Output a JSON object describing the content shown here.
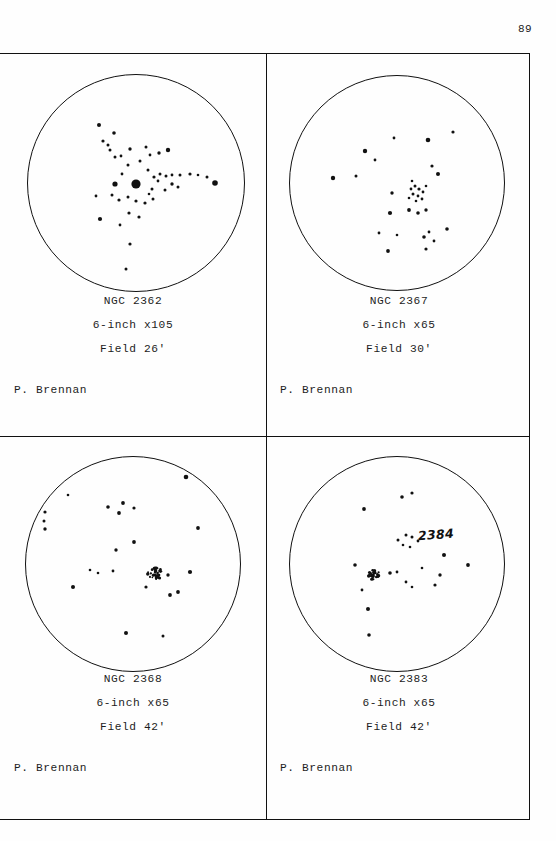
{
  "page": {
    "number": "89",
    "observer_default": "P. Brennan"
  },
  "panels": [
    {
      "id": "ngc-2362",
      "object_name": "NGC 2362",
      "instrument": "6-inch x105",
      "field": "Field 26'",
      "observer": "P. Brennan",
      "circle": {
        "cx": 136,
        "cy": 130,
        "r": 109
      },
      "annotation": null,
      "stars": [
        {
          "x": 136,
          "y": 131,
          "r": 4.6
        },
        {
          "x": 115,
          "y": 131,
          "r": 2.6
        },
        {
          "x": 148,
          "y": 117,
          "r": 1.5
        },
        {
          "x": 154,
          "y": 124,
          "r": 1.6
        },
        {
          "x": 158,
          "y": 128,
          "r": 1.4
        },
        {
          "x": 152,
          "y": 136,
          "r": 1.5
        },
        {
          "x": 149,
          "y": 141,
          "r": 1.3
        },
        {
          "x": 160,
          "y": 121,
          "r": 1.5
        },
        {
          "x": 166,
          "y": 123,
          "r": 1.5
        },
        {
          "x": 172,
          "y": 122,
          "r": 1.4
        },
        {
          "x": 180,
          "y": 122,
          "r": 1.5
        },
        {
          "x": 190,
          "y": 121,
          "r": 1.6
        },
        {
          "x": 198,
          "y": 122,
          "r": 1.3
        },
        {
          "x": 207,
          "y": 124,
          "r": 1.5
        },
        {
          "x": 122,
          "y": 121,
          "r": 1.4
        },
        {
          "x": 128,
          "y": 112,
          "r": 1.5
        },
        {
          "x": 140,
          "y": 108,
          "r": 1.5
        },
        {
          "x": 150,
          "y": 102,
          "r": 1.4
        },
        {
          "x": 159,
          "y": 100,
          "r": 1.7
        },
        {
          "x": 168,
          "y": 97,
          "r": 2.2
        },
        {
          "x": 146,
          "y": 94,
          "r": 1.5
        },
        {
          "x": 130,
          "y": 96,
          "r": 1.7
        },
        {
          "x": 121,
          "y": 103,
          "r": 1.4
        },
        {
          "x": 115,
          "y": 104,
          "r": 1.5
        },
        {
          "x": 110,
          "y": 97,
          "r": 1.5
        },
        {
          "x": 108,
          "y": 92,
          "r": 1.5
        },
        {
          "x": 103,
          "y": 88,
          "r": 1.6
        },
        {
          "x": 114,
          "y": 80,
          "r": 1.8
        },
        {
          "x": 99,
          "y": 72,
          "r": 2.0
        },
        {
          "x": 128,
          "y": 144,
          "r": 1.5
        },
        {
          "x": 136,
          "y": 148,
          "r": 1.6
        },
        {
          "x": 145,
          "y": 150,
          "r": 1.6
        },
        {
          "x": 153,
          "y": 146,
          "r": 1.5
        },
        {
          "x": 119,
          "y": 147,
          "r": 1.6
        },
        {
          "x": 112,
          "y": 142,
          "r": 1.5
        },
        {
          "x": 129,
          "y": 160,
          "r": 1.6
        },
        {
          "x": 139,
          "y": 164,
          "r": 1.6
        },
        {
          "x": 120,
          "y": 172,
          "r": 1.4
        },
        {
          "x": 100,
          "y": 166,
          "r": 2.1
        },
        {
          "x": 96,
          "y": 143,
          "r": 1.4
        },
        {
          "x": 215,
          "y": 130,
          "r": 2.8
        },
        {
          "x": 130,
          "y": 191,
          "r": 1.6
        },
        {
          "x": 126,
          "y": 216,
          "r": 1.5
        },
        {
          "x": 172,
          "y": 131,
          "r": 1.7
        },
        {
          "x": 178,
          "y": 134,
          "r": 1.5
        },
        {
          "x": 165,
          "y": 137,
          "r": 1.5
        }
      ]
    },
    {
      "id": "ngc-2367",
      "object_name": "NGC 2367",
      "instrument": "6-inch x65",
      "field": "Field 30'",
      "observer": "P. Brennan",
      "circle": {
        "cx": 131,
        "cy": 130,
        "r": 108
      },
      "annotation": null,
      "stars": [
        {
          "x": 145,
          "y": 136,
          "r": 1.4
        },
        {
          "x": 149,
          "y": 133,
          "r": 1.5
        },
        {
          "x": 153,
          "y": 136,
          "r": 1.6
        },
        {
          "x": 147,
          "y": 141,
          "r": 1.5
        },
        {
          "x": 152,
          "y": 143,
          "r": 1.4
        },
        {
          "x": 157,
          "y": 139,
          "r": 1.4
        },
        {
          "x": 143,
          "y": 145,
          "r": 1.3
        },
        {
          "x": 150,
          "y": 148,
          "r": 1.3
        },
        {
          "x": 156,
          "y": 146,
          "r": 1.4
        },
        {
          "x": 160,
          "y": 133,
          "r": 1.3
        },
        {
          "x": 146,
          "y": 128,
          "r": 1.3
        },
        {
          "x": 143,
          "y": 157,
          "r": 1.9
        },
        {
          "x": 152,
          "y": 160,
          "r": 1.8
        },
        {
          "x": 160,
          "y": 157,
          "r": 1.7
        },
        {
          "x": 124,
          "y": 160,
          "r": 2.1
        },
        {
          "x": 126,
          "y": 140,
          "r": 1.7
        },
        {
          "x": 172,
          "y": 121,
          "r": 2.0
        },
        {
          "x": 166,
          "y": 113,
          "r": 1.6
        },
        {
          "x": 162,
          "y": 87,
          "r": 2.3
        },
        {
          "x": 128,
          "y": 85,
          "r": 1.4
        },
        {
          "x": 187,
          "y": 79,
          "r": 1.6
        },
        {
          "x": 99,
          "y": 98,
          "r": 2.2
        },
        {
          "x": 109,
          "y": 107,
          "r": 1.4
        },
        {
          "x": 90,
          "y": 123,
          "r": 1.5
        },
        {
          "x": 67,
          "y": 125,
          "r": 2.2
        },
        {
          "x": 113,
          "y": 180,
          "r": 1.4
        },
        {
          "x": 122,
          "y": 198,
          "r": 1.9
        },
        {
          "x": 158,
          "y": 184,
          "r": 1.8
        },
        {
          "x": 163,
          "y": 179,
          "r": 1.4
        },
        {
          "x": 168,
          "y": 188,
          "r": 1.4
        },
        {
          "x": 160,
          "y": 196,
          "r": 1.6
        },
        {
          "x": 181,
          "y": 176,
          "r": 1.8
        },
        {
          "x": 131,
          "y": 182,
          "r": 1.3
        }
      ]
    },
    {
      "id": "ngc-2368",
      "object_name": "NGC 2368",
      "instrument": "6-inch x65",
      "field": "Field 42'",
      "observer": "P. Brennan",
      "circle": {
        "cx": 133,
        "cy": 127,
        "r": 108
      },
      "annotation": null,
      "cluster_clump": {
        "x": 155,
        "y": 136,
        "count": 34,
        "spread": 7.5
      },
      "stars": [
        {
          "x": 168,
          "y": 138,
          "r": 1.7
        },
        {
          "x": 146,
          "y": 150,
          "r": 1.6
        },
        {
          "x": 170,
          "y": 158,
          "r": 1.9
        },
        {
          "x": 190,
          "y": 135,
          "r": 2.1
        },
        {
          "x": 113,
          "y": 134,
          "r": 1.4
        },
        {
          "x": 90,
          "y": 133,
          "r": 1.3
        },
        {
          "x": 116,
          "y": 113,
          "r": 1.7
        },
        {
          "x": 134,
          "y": 105,
          "r": 1.9
        },
        {
          "x": 198,
          "y": 91,
          "r": 1.9
        },
        {
          "x": 119,
          "y": 76,
          "r": 1.9
        },
        {
          "x": 108,
          "y": 70,
          "r": 1.8
        },
        {
          "x": 123,
          "y": 66,
          "r": 1.9
        },
        {
          "x": 134,
          "y": 71,
          "r": 1.6
        },
        {
          "x": 186,
          "y": 40,
          "r": 2.3
        },
        {
          "x": 68,
          "y": 58,
          "r": 1.3
        },
        {
          "x": 45,
          "y": 75,
          "r": 1.6
        },
        {
          "x": 44,
          "y": 84,
          "r": 1.5
        },
        {
          "x": 45,
          "y": 92,
          "r": 1.7
        },
        {
          "x": 73,
          "y": 150,
          "r": 2.0
        },
        {
          "x": 126,
          "y": 196,
          "r": 2.0
        },
        {
          "x": 163,
          "y": 199,
          "r": 1.5
        },
        {
          "x": 178,
          "y": 155,
          "r": 1.9
        },
        {
          "x": 98,
          "y": 136,
          "r": 1.3
        }
      ]
    },
    {
      "id": "ngc-2383",
      "object_name": "NGC 2383",
      "instrument": "6-inch x65",
      "field": "Field 42'",
      "observer": "P. Brennan",
      "circle": {
        "cx": 131,
        "cy": 127,
        "r": 108
      },
      "annotation": {
        "text": "2384",
        "x": 152,
        "y": 90
      },
      "cluster_clump": {
        "x": 108,
        "y": 137,
        "count": 30,
        "spread": 6.5
      },
      "stars": [
        {
          "x": 124,
          "y": 136,
          "r": 1.8
        },
        {
          "x": 131,
          "y": 135,
          "r": 1.4
        },
        {
          "x": 89,
          "y": 128,
          "r": 1.8
        },
        {
          "x": 96,
          "y": 153,
          "r": 1.4
        },
        {
          "x": 140,
          "y": 145,
          "r": 1.4
        },
        {
          "x": 146,
          "y": 150,
          "r": 1.3
        },
        {
          "x": 140,
          "y": 98,
          "r": 1.5
        },
        {
          "x": 146,
          "y": 100,
          "r": 1.5
        },
        {
          "x": 152,
          "y": 104,
          "r": 1.4
        },
        {
          "x": 132,
          "y": 103,
          "r": 1.5
        },
        {
          "x": 137,
          "y": 108,
          "r": 1.3
        },
        {
          "x": 144,
          "y": 110,
          "r": 1.3
        },
        {
          "x": 136,
          "y": 60,
          "r": 1.8
        },
        {
          "x": 146,
          "y": 56,
          "r": 1.6
        },
        {
          "x": 98,
          "y": 72,
          "r": 1.9
        },
        {
          "x": 178,
          "y": 118,
          "r": 2.0
        },
        {
          "x": 174,
          "y": 138,
          "r": 1.7
        },
        {
          "x": 169,
          "y": 148,
          "r": 1.6
        },
        {
          "x": 202,
          "y": 128,
          "r": 1.9
        },
        {
          "x": 102,
          "y": 172,
          "r": 2.0
        },
        {
          "x": 103,
          "y": 198,
          "r": 1.8
        },
        {
          "x": 156,
          "y": 131,
          "r": 1.3
        }
      ]
    }
  ]
}
